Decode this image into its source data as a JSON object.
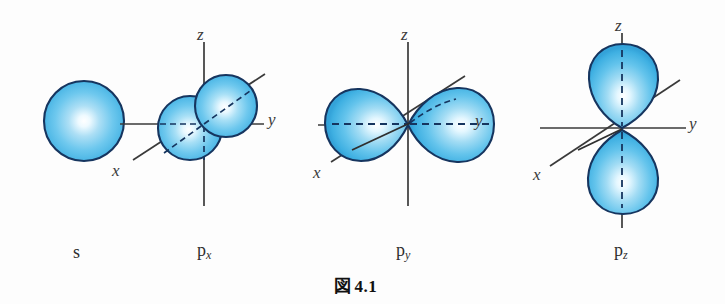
{
  "figure": {
    "caption_symbol": "図",
    "caption_number": "4.1",
    "background_color": "#fdfdfd"
  },
  "style": {
    "lobe_fill_light": "#ffffff",
    "lobe_fill_mid": "#7fd0ef",
    "lobe_fill_dark": "#3aa9dd",
    "lobe_outline": "#16355f",
    "axis_color": "#3a3a3a",
    "label_color": "#2e2e2e"
  },
  "orbitals": [
    {
      "id": "s",
      "label": "s",
      "label_sub": "",
      "shape": "sphere",
      "center": {
        "x": 84,
        "y": 121
      },
      "radius": 40,
      "axes": [],
      "axis_labels": []
    },
    {
      "id": "px",
      "label": "p",
      "label_sub": "x",
      "shape": "two-spheres-along-x",
      "center": {
        "x": 204,
        "y": 124
      },
      "axes": [
        "z",
        "y",
        "x"
      ],
      "axis_labels": [
        {
          "name": "z",
          "text": "z",
          "x": 198,
          "y": 33
        },
        {
          "name": "y",
          "text": "y",
          "x": 268,
          "y": 112
        },
        {
          "name": "x",
          "text": "x",
          "x": 112,
          "y": 163
        }
      ]
    },
    {
      "id": "py",
      "label": "p",
      "label_sub": "y",
      "shape": "two-lobes-along-y",
      "center": {
        "x": 408,
        "y": 125
      },
      "axes": [
        "z",
        "y",
        "x"
      ],
      "axis_labels": [
        {
          "name": "z",
          "text": "z",
          "x": 402,
          "y": 33
        },
        {
          "name": "y",
          "text": "y",
          "x": 474,
          "y": 113
        },
        {
          "name": "x",
          "text": "x",
          "x": 315,
          "y": 165
        }
      ]
    },
    {
      "id": "pz",
      "label": "p",
      "label_sub": "z",
      "shape": "two-lobes-along-z",
      "center": {
        "x": 622,
        "y": 128
      },
      "axes": [
        "z",
        "y",
        "x"
      ],
      "axis_labels": [
        {
          "name": "z",
          "text": "z",
          "x": 616,
          "y": 24
        },
        {
          "name": "y",
          "text": "y",
          "x": 688,
          "y": 116
        },
        {
          "name": "x",
          "text": "x",
          "x": 534,
          "y": 167
        }
      ]
    }
  ],
  "labels": {
    "s_label": "s",
    "px_label": "p",
    "px_sub": "x",
    "py_label": "p",
    "py_sub": "y",
    "pz_label": "p",
    "pz_sub": "z"
  }
}
